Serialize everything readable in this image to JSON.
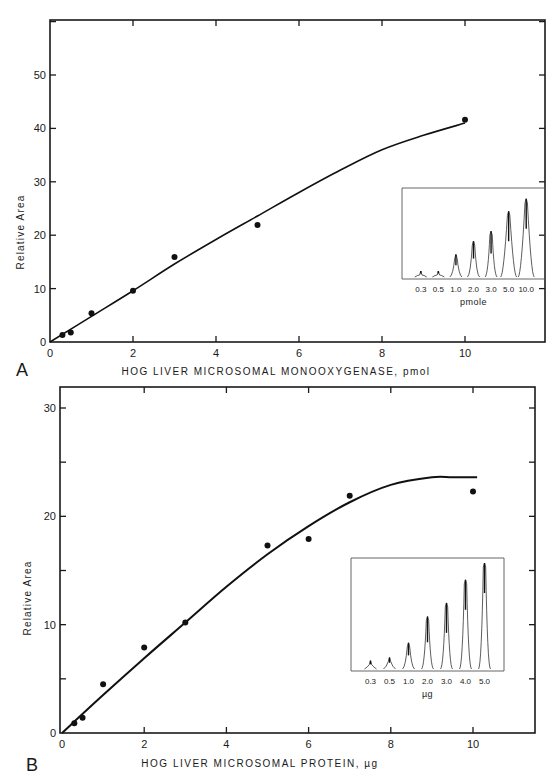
{
  "chart_data": [
    {
      "panel": "A",
      "type": "scatter",
      "title": "",
      "xlabel": "HOG LIVER MICROSOMAL MONOOXYGENASE, pmol",
      "ylabel": "Relative Area",
      "xlim": [
        0,
        12
      ],
      "ylim": [
        0,
        60
      ],
      "x_ticks": [
        0,
        2,
        4,
        6,
        8,
        10
      ],
      "y_ticks": [
        0,
        10,
        20,
        30,
        40,
        50
      ],
      "grid": false,
      "points": [
        {
          "x": 0.3,
          "y": 1.3
        },
        {
          "x": 0.5,
          "y": 1.8
        },
        {
          "x": 1,
          "y": 5.4
        },
        {
          "x": 2,
          "y": 9.6
        },
        {
          "x": 3,
          "y": 15.9
        },
        {
          "x": 5,
          "y": 21.9
        },
        {
          "x": 10,
          "y": 41.6
        }
      ],
      "fit_curve": [
        [
          0,
          0
        ],
        [
          1,
          4.8
        ],
        [
          2,
          9.6
        ],
        [
          3,
          14.6
        ],
        [
          4,
          19.2
        ],
        [
          5,
          23.6
        ],
        [
          6,
          28
        ],
        [
          7,
          32.2
        ],
        [
          8,
          36
        ],
        [
          9,
          38.7
        ],
        [
          10,
          41
        ]
      ],
      "inset": {
        "type": "chromatogram",
        "unit_label": "pmole",
        "peaks": [
          {
            "label": "0.3",
            "height": 0.04
          },
          {
            "label": "0.5",
            "height": 0.06
          },
          {
            "label": "1.0",
            "height": 0.26
          },
          {
            "label": "2.0",
            "height": 0.42
          },
          {
            "label": "3.0",
            "height": 0.54
          },
          {
            "label": "5.0",
            "height": 0.78
          },
          {
            "label": "10.0",
            "height": 0.93
          }
        ]
      }
    },
    {
      "panel": "B",
      "type": "scatter",
      "title": "",
      "xlabel": "HOG LIVER MICROSOMAL PROTEIN, µg",
      "ylabel": "Relative Area",
      "xlim": [
        0,
        11.5
      ],
      "ylim": [
        0,
        32
      ],
      "x_ticks": [
        0,
        2,
        4,
        6,
        8,
        10
      ],
      "y_ticks": [
        0,
        10,
        20,
        30
      ],
      "grid": false,
      "points": [
        {
          "x": 0.3,
          "y": 0.9
        },
        {
          "x": 0.5,
          "y": 1.4
        },
        {
          "x": 1,
          "y": 4.5
        },
        {
          "x": 2,
          "y": 7.9
        },
        {
          "x": 3,
          "y": 10.2
        },
        {
          "x": 5,
          "y": 17.3
        },
        {
          "x": 6,
          "y": 17.9
        },
        {
          "x": 7,
          "y": 21.9
        },
        {
          "x": 10,
          "y": 22.3
        }
      ],
      "fit_curve": [
        [
          0,
          0
        ],
        [
          1,
          3.5
        ],
        [
          2,
          6.9
        ],
        [
          3,
          10.2
        ],
        [
          4,
          13.5
        ],
        [
          5,
          16.5
        ],
        [
          6,
          19.1
        ],
        [
          7,
          21.3
        ],
        [
          8,
          22.9
        ],
        [
          9,
          23.6
        ],
        [
          9.5,
          23.6
        ],
        [
          10.1,
          23.6
        ]
      ],
      "inset": {
        "type": "chromatogram",
        "unit_label": "µg",
        "peaks": [
          {
            "label": "0.3",
            "height": 0.07
          },
          {
            "label": "0.5",
            "height": 0.1
          },
          {
            "label": "1.0",
            "height": 0.24
          },
          {
            "label": "2.0",
            "height": 0.49
          },
          {
            "label": "3.0",
            "height": 0.62
          },
          {
            "label": "4.0",
            "height": 0.84
          },
          {
            "label": "5.0",
            "height": 1.0
          }
        ]
      }
    }
  ],
  "panels": {
    "a": {
      "letter": "A",
      "xlabel": "HOG LIVER MICROSOMAL MONOOXYGENASE, pmol",
      "ylabel": "Relative Area",
      "inset_unit": "pmole"
    },
    "b": {
      "letter": "B",
      "xlabel": "HOG LIVER MICROSOMAL PROTEIN, µg",
      "ylabel": "Relative Area",
      "inset_unit": "µg"
    }
  }
}
